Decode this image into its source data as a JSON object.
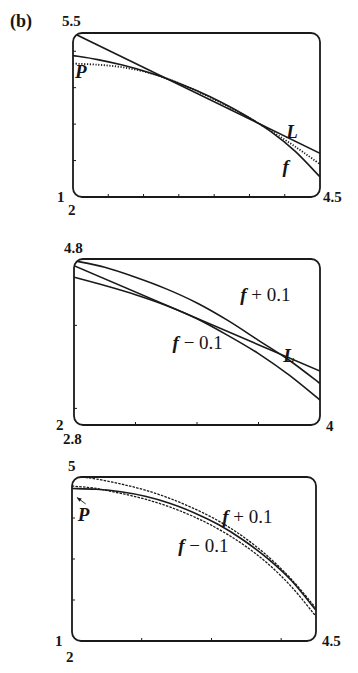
{
  "figure": {
    "part_label": "(b)"
  },
  "chart_data": [
    {
      "type": "line",
      "title": "",
      "panel": 1,
      "frame": {
        "left": 73,
        "top": 33,
        "right": 320,
        "bottom": 197
      },
      "xlim": [
        2,
        4.5
      ],
      "ylim": [
        1,
        5.5
      ],
      "x_tick_labels": {
        "min": "2",
        "max": "4.5"
      },
      "y_tick_labels": {
        "min": "1",
        "max": "5.5"
      },
      "x_ticks": [
        2.357,
        2.714,
        3.071,
        3.429,
        3.786,
        4.143
      ],
      "y_ticks": [
        2,
        3,
        4,
        5
      ],
      "grid": false,
      "series": [
        {
          "name": "L",
          "style": "solid",
          "label": "L",
          "x": [
            2.0,
            4.5
          ],
          "y": [
            5.5,
            2.2
          ]
        },
        {
          "name": "f",
          "style": "solid",
          "label": "f",
          "x": [
            2.0,
            2.25,
            2.5,
            2.75,
            3.0,
            3.25,
            3.5,
            3.75,
            4.0,
            4.25,
            4.5
          ],
          "y": [
            4.88,
            4.77,
            4.62,
            4.43,
            4.2,
            3.92,
            3.6,
            3.23,
            2.8,
            2.25,
            1.55
          ]
        },
        {
          "name": "P",
          "style": "dotted",
          "label": "P",
          "x": [
            2.0,
            2.25,
            2.5,
            2.75,
            3.0,
            3.25,
            3.5,
            3.75,
            4.0,
            4.25,
            4.5
          ],
          "y": [
            4.66,
            4.63,
            4.56,
            4.42,
            4.2,
            3.91,
            3.58,
            3.22,
            2.82,
            2.38,
            1.9
          ]
        }
      ],
      "annotations": [
        {
          "text": "P",
          "x": 2.08,
          "y": 4.4
        },
        {
          "text": "L",
          "x": 4.22,
          "y": 2.75
        },
        {
          "text": "f",
          "x": 4.18,
          "y": 1.8
        }
      ]
    },
    {
      "type": "line",
      "title": "",
      "panel": 2,
      "frame": {
        "left": 74,
        "top": 259,
        "right": 320,
        "bottom": 425
      },
      "xlim": [
        2,
        4
      ],
      "ylim": [
        2.8,
        4.8
      ],
      "x_tick_labels": {
        "min": "2",
        "max": "4"
      },
      "y_tick_labels": {
        "min": "2.8",
        "max": "4.8"
      },
      "x_ticks": [
        2.5,
        3.0,
        3.5
      ],
      "y_ticks": [
        3.0,
        4.0
      ],
      "grid": false,
      "series": [
        {
          "name": "L",
          "style": "solid",
          "label": "L",
          "x": [
            2.0,
            4.0
          ],
          "y": [
            4.72,
            3.45
          ]
        },
        {
          "name": "f + 0.1",
          "style": "solid",
          "label": "f + 0.1",
          "x": [
            2.0,
            2.25,
            2.5,
            2.75,
            3.0,
            3.25,
            3.5,
            3.75,
            4.0
          ],
          "y": [
            4.78,
            4.7,
            4.58,
            4.44,
            4.27,
            4.06,
            3.82,
            3.58,
            3.3
          ]
        },
        {
          "name": "f - 0.1",
          "style": "solid",
          "label": "f − 0.1",
          "x": [
            2.0,
            2.25,
            2.5,
            2.75,
            3.0,
            3.25,
            3.5,
            3.75,
            4.0
          ],
          "y": [
            4.58,
            4.48,
            4.37,
            4.24,
            4.08,
            3.88,
            3.66,
            3.4,
            3.1
          ]
        }
      ],
      "annotations": [
        {
          "text": "f + 0.1",
          "x": 3.4,
          "y": 4.35
        },
        {
          "text": "f − 0.1",
          "x": 2.85,
          "y": 3.78
        },
        {
          "text": "L",
          "x": 3.75,
          "y": 3.62
        }
      ]
    },
    {
      "type": "line",
      "title": "",
      "panel": 3,
      "frame": {
        "left": 72,
        "top": 477,
        "right": 316,
        "bottom": 641
      },
      "xlim": [
        2,
        4.5
      ],
      "ylim": [
        1,
        5
      ],
      "x_tick_labels": {
        "min": "2",
        "max": "4.5"
      },
      "y_tick_labels": {
        "min": "1",
        "max": "5"
      },
      "x_ticks": [
        2.714,
        3.429,
        4.143
      ],
      "y_ticks": [
        2,
        3,
        4
      ],
      "grid": false,
      "series": [
        {
          "name": "f + 0.1",
          "style": "dashed",
          "label": "f + 0.1",
          "x": [
            2.1,
            2.25,
            2.5,
            2.75,
            3.0,
            3.25,
            3.5,
            3.75,
            4.0,
            4.25,
            4.5
          ],
          "y": [
            5.0,
            4.95,
            4.83,
            4.68,
            4.48,
            4.23,
            3.93,
            3.55,
            3.08,
            2.5,
            1.8
          ]
        },
        {
          "name": "P",
          "style": "solid",
          "label": "P",
          "x": [
            2.0,
            2.25,
            2.5,
            2.75,
            3.0,
            3.25,
            3.5,
            3.75,
            4.0,
            4.25,
            4.5
          ],
          "y": [
            4.72,
            4.7,
            4.64,
            4.53,
            4.36,
            4.13,
            3.84,
            3.47,
            3.02,
            2.47,
            1.75
          ]
        },
        {
          "name": "f - 0.1",
          "style": "dashed",
          "label": "f − 0.1",
          "x": [
            2.0,
            2.25,
            2.5,
            2.75,
            3.0,
            3.25,
            3.5,
            3.75,
            4.0,
            4.25,
            4.5
          ],
          "y": [
            4.78,
            4.72,
            4.6,
            4.46,
            4.27,
            4.03,
            3.73,
            3.36,
            2.9,
            2.32,
            1.6
          ]
        }
      ],
      "annotations": [
        {
          "text": "f + 0.1",
          "x": 3.6,
          "y": 4.0
        },
        {
          "text": "f − 0.1",
          "x": 3.15,
          "y": 3.3
        },
        {
          "text": "P",
          "x": 2.12,
          "y": 4.05,
          "arrow_to": [
            2.05,
            4.55
          ]
        }
      ]
    }
  ]
}
